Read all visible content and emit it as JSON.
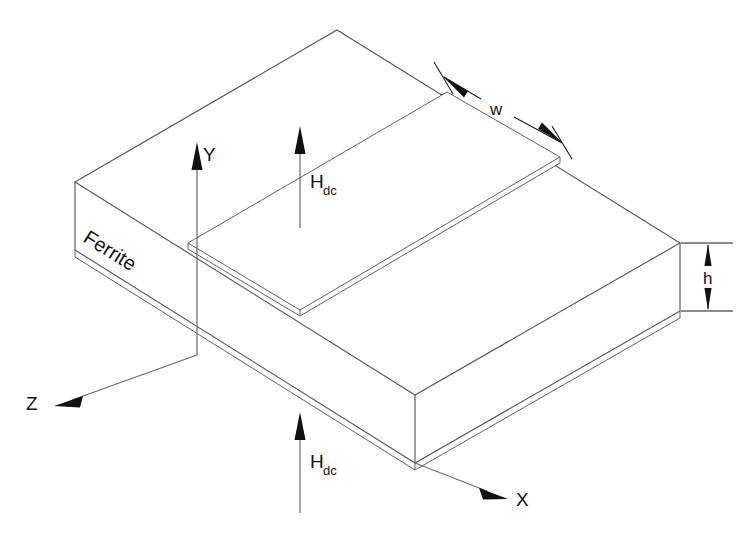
{
  "figure": {
    "domain": "diagram",
    "kind": "3d-isometric-technical-drawing",
    "background_color": "#ffffff",
    "line_color": "#555a5e",
    "text_color": "#111111"
  },
  "labels": {
    "material": "Ferrite",
    "axis_x": "X",
    "axis_y": "Y",
    "axis_z": "Z",
    "dim_width": "w",
    "dim_height": "h",
    "field_symbol": "H",
    "field_subscript": "dc"
  },
  "annotations": [
    {
      "name": "ferrite-label",
      "text": "Ferrite",
      "placement": "left-end-face",
      "rotated": true,
      "rotation_deg": 33
    },
    {
      "name": "bias-field-upper",
      "text": "Hdc",
      "symbol": "H",
      "subscript": "dc",
      "placement": "above-substrate-top-face",
      "direction": "up"
    },
    {
      "name": "bias-field-lower",
      "text": "Hdc",
      "symbol": "H",
      "subscript": "dc",
      "placement": "below-substrate-front",
      "direction": "up"
    },
    {
      "name": "strip-width-dimension",
      "text": "w",
      "placement": "upper-right-along-strip-width",
      "arrows": "both-ends-outward"
    },
    {
      "name": "substrate-height-dimension",
      "text": "h",
      "placement": "right-end-face-vertical",
      "arrows": "both-ends-outward"
    }
  ],
  "axes": [
    {
      "name": "y-axis",
      "label": "Y",
      "direction": "up",
      "tip": [
        197,
        145
      ],
      "tail": [
        197,
        355
      ]
    },
    {
      "name": "x-axis",
      "label": "X",
      "direction": "down-right",
      "tip": [
        508,
        497
      ],
      "tail": [
        415,
        463
      ]
    },
    {
      "name": "z-axis",
      "label": "Z",
      "direction": "down-left",
      "tip": [
        56,
        405
      ],
      "tail": [
        197,
        355
      ]
    }
  ],
  "geometry": {
    "substrate": {
      "name": "ferrite-substrate-slab",
      "top_face": [
        [
          75,
          182
        ],
        [
          337,
          30
        ],
        [
          680,
          243
        ],
        [
          415,
          395
        ]
      ],
      "height_px": 68,
      "ground_plane_thickness_px": 7
    },
    "strip": {
      "name": "microstrip-conductor",
      "thickness_px": 6,
      "top_face": [
        [
          188,
          243
        ],
        [
          447,
          92
        ],
        [
          560,
          157
        ],
        [
          300,
          310
        ]
      ]
    }
  }
}
